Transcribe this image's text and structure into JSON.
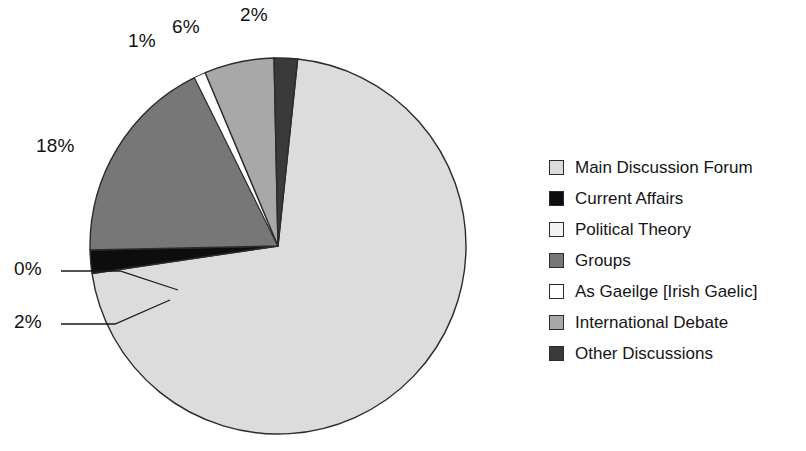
{
  "chart_data": {
    "type": "pie",
    "title": "",
    "subtitle": "",
    "xlabel": "",
    "ylabel": "",
    "grid": false,
    "legend_position": "right",
    "categories": [
      "Main Discussion Forum",
      "Current Affairs",
      "Political Theory",
      "Groups",
      "As Gaeilge [Irish Gaelic]",
      "International Debate",
      "Other Discussions"
    ],
    "values": [
      71,
      2,
      0,
      18,
      1,
      6,
      2
    ],
    "data_labels": [
      "71%",
      "2%",
      "0%",
      "18%",
      "1%",
      "6%",
      "2%"
    ],
    "visible_data_labels": [
      "2%",
      "6%",
      "1%",
      "18%",
      "0%",
      "2%"
    ],
    "colors": [
      "#dcdcdc",
      "#0d0d0d",
      "#f2f2f2",
      "#777777",
      "#ffffff",
      "#a8a8a8",
      "#3a3a3a"
    ],
    "slice_outline_color": "#2b2b2b",
    "start_angle_deg": -84,
    "direction": "clockwise"
  },
  "pie": {
    "labels": [
      {
        "id": "label-other-discussions",
        "text": "2%",
        "x": 240,
        "y": 4,
        "leader": false
      },
      {
        "id": "label-international-debate",
        "text": "6%",
        "x": 172,
        "y": 16,
        "leader": false
      },
      {
        "id": "label-as-gaeilge",
        "text": "1%",
        "x": 128,
        "y": 30,
        "leader": false
      },
      {
        "id": "label-groups",
        "text": "18%",
        "x": 36,
        "y": 135,
        "leader": false
      },
      {
        "id": "label-political-theory",
        "text": "0%",
        "x": 14,
        "y": 258,
        "leader": true
      },
      {
        "id": "label-current-affairs",
        "text": "2%",
        "x": 14,
        "y": 311,
        "leader": true
      }
    ]
  },
  "legend": {
    "items": [
      {
        "label": "Main Discussion Forum",
        "color": "#dcdcdc"
      },
      {
        "label": "Current Affairs",
        "color": "#0d0d0d"
      },
      {
        "label": "Political Theory",
        "color": "#f2f2f2"
      },
      {
        "label": "Groups",
        "color": "#777777"
      },
      {
        "label": "As Gaeilge [Irish Gaelic]",
        "color": "#ffffff"
      },
      {
        "label": "International Debate",
        "color": "#a8a8a8"
      },
      {
        "label": "Other Discussions",
        "color": "#3a3a3a"
      }
    ]
  }
}
